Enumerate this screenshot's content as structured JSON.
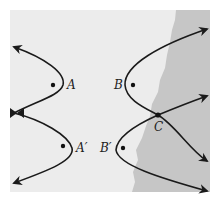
{
  "diagram": {
    "background_color": "#ececec",
    "shaded_color": "#c6c6c6",
    "curve_color": "#1a1a1a",
    "labels": {
      "A": "A",
      "A_prime": "A′",
      "B": "B",
      "B_prime": "B′",
      "C": "C"
    },
    "points": [
      {
        "name": "A",
        "x": 53,
        "y": 85
      },
      {
        "name": "B",
        "x": 133,
        "y": 85
      },
      {
        "name": "A′",
        "x": 63,
        "y": 146
      },
      {
        "name": "B′",
        "x": 123,
        "y": 148
      },
      {
        "name": "C",
        "x": 158,
        "y": 115
      }
    ]
  }
}
